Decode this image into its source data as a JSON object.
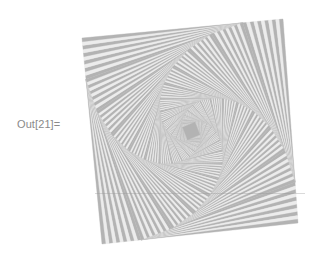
{
  "notebook": {
    "output_label": "Out[21]="
  },
  "graphic": {
    "description": "nested rotated squares whirl with alternating gray stripes",
    "outer_square": {
      "corners": [
        [
          82,
          38
        ],
        [
          283,
          19
        ],
        [
          298,
          223
        ],
        [
          102,
          244
        ]
      ]
    },
    "inset_fraction": 0.2,
    "levels": 14,
    "stripes_per_triangle": 11,
    "colors": {
      "dark": "#b3b3b3",
      "light": "#ececec",
      "background": "#ffffff",
      "label": "#8a8a8a"
    }
  }
}
